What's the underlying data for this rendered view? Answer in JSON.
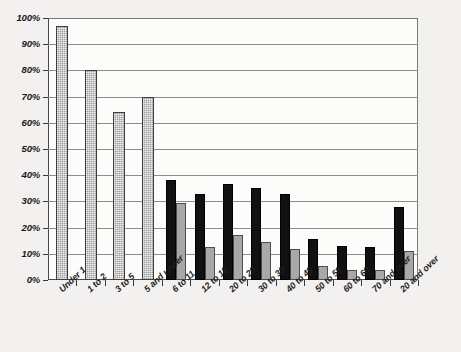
{
  "chart_data": {
    "type": "bar",
    "title": "",
    "subtitle": "",
    "xlabel": "",
    "ylabel": "",
    "ylim": [
      0,
      100
    ],
    "y_tick_labels": [
      "100%",
      "90%",
      "80%",
      "70%",
      "60%",
      "50%",
      "40%",
      "30%",
      "20%",
      "10%",
      "0%"
    ],
    "y_tick_values": [
      100,
      90,
      80,
      70,
      60,
      50,
      40,
      30,
      20,
      10,
      0
    ],
    "grid": "horizontal",
    "legend_position": "none",
    "categories": [
      "Under 1",
      "1 to 2",
      "3 to 5",
      "5 and under",
      "6 to 11",
      "12 to 19",
      "20 to 29",
      "30 to 39",
      "40 to 49",
      "50 to 59",
      "60 to 69",
      "70 and over",
      "20 and over"
    ],
    "series": [
      {
        "name": "series-1",
        "style": "black",
        "values": [
          null,
          null,
          null,
          null,
          38,
          33,
          36.5,
          35,
          33,
          15.5,
          13,
          12.5,
          28
        ]
      },
      {
        "name": "series-2",
        "style": "gray",
        "values": [
          97,
          80,
          64,
          70,
          29.5,
          12.5,
          17,
          14.5,
          12,
          5.5,
          4,
          4,
          11
        ]
      }
    ],
    "colors": {
      "series_1_fill": "#111111",
      "series_2_fill": "#a8a8a8",
      "hatched_fill": "#9e9e9e",
      "gridline": "#8d8d8d",
      "axis": "#3a3a3a",
      "plot_background": "#fcfcfb",
      "page_background": "#f2f1ef"
    }
  }
}
